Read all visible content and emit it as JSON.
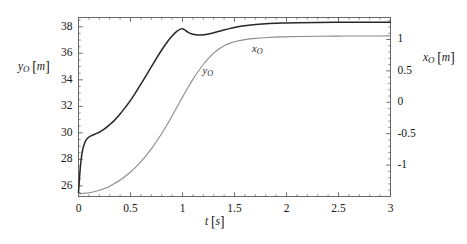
{
  "chart_data": {
    "type": "line",
    "title": "",
    "xlabel": "t [s]",
    "ylabel": "y_O [m]",
    "y2label": "x_O [m]",
    "xlim": [
      0,
      3
    ],
    "ylim": [
      25.2,
      38.7
    ],
    "y2lim": [
      -1.5,
      1.35
    ],
    "grid": false,
    "legend": "inline-curve-labels",
    "xticks": [
      "0",
      "0.5",
      "1",
      "1.5",
      "2",
      "2.5",
      "3"
    ],
    "xtick_values": [
      0,
      0.5,
      1,
      1.5,
      2,
      2.5,
      3
    ],
    "yticks": [
      "26",
      "28",
      "30",
      "32",
      "34",
      "36",
      "38"
    ],
    "ytick_values": [
      26,
      28,
      30,
      32,
      34,
      36,
      38
    ],
    "y2ticks": [
      "-1",
      "-0.5",
      "0",
      "0.5",
      "1"
    ],
    "y2tick_values": [
      -1,
      -0.5,
      0,
      0.5,
      1
    ],
    "x_minor_step": 0.1,
    "y_minor_step": 0.5,
    "y2_minor_step": 0.1,
    "series": [
      {
        "name": "y_O",
        "axis": "left",
        "color": "#262626",
        "width": 1.5,
        "label_text": "y_O",
        "label_x": 1.0,
        "label_y": 34.6,
        "points": [
          [
            0.0,
            25.5
          ],
          [
            0.008,
            26.4
          ],
          [
            0.016,
            27.25
          ],
          [
            0.025,
            27.95
          ],
          [
            0.035,
            28.5
          ],
          [
            0.045,
            28.9
          ],
          [
            0.058,
            29.2
          ],
          [
            0.07,
            29.42
          ],
          [
            0.085,
            29.58
          ],
          [
            0.1,
            29.68
          ],
          [
            0.12,
            29.77
          ],
          [
            0.145,
            29.86
          ],
          [
            0.175,
            29.96
          ],
          [
            0.21,
            30.1
          ],
          [
            0.25,
            30.3
          ],
          [
            0.3,
            30.62
          ],
          [
            0.35,
            30.98
          ],
          [
            0.4,
            31.42
          ],
          [
            0.45,
            31.92
          ],
          [
            0.5,
            32.45
          ],
          [
            0.55,
            33.05
          ],
          [
            0.6,
            33.68
          ],
          [
            0.65,
            34.32
          ],
          [
            0.7,
            34.98
          ],
          [
            0.75,
            35.62
          ],
          [
            0.8,
            36.25
          ],
          [
            0.85,
            36.82
          ],
          [
            0.9,
            37.3
          ],
          [
            0.945,
            37.65
          ],
          [
            0.98,
            37.82
          ],
          [
            1.0,
            37.86
          ],
          [
            1.02,
            37.78
          ],
          [
            1.05,
            37.6
          ],
          [
            1.09,
            37.46
          ],
          [
            1.13,
            37.39
          ],
          [
            1.18,
            37.38
          ],
          [
            1.24,
            37.44
          ],
          [
            1.3,
            37.55
          ],
          [
            1.38,
            37.72
          ],
          [
            1.46,
            37.88
          ],
          [
            1.56,
            38.04
          ],
          [
            1.68,
            38.16
          ],
          [
            1.8,
            38.23
          ],
          [
            1.95,
            38.28
          ],
          [
            2.1,
            38.31
          ],
          [
            2.3,
            38.33
          ],
          [
            2.55,
            38.34
          ],
          [
            2.8,
            38.35
          ],
          [
            3.0,
            38.35
          ]
        ]
      },
      {
        "name": "x_O",
        "axis": "right",
        "color": "#8c8c8c",
        "width": 1.1,
        "label_text": "x_O",
        "label_x": 1.62,
        "label_y_right": 0.9,
        "points": [
          [
            0.0,
            -1.455
          ],
          [
            0.05,
            -1.45
          ],
          [
            0.1,
            -1.44
          ],
          [
            0.15,
            -1.425
          ],
          [
            0.2,
            -1.402
          ],
          [
            0.25,
            -1.372
          ],
          [
            0.3,
            -1.335
          ],
          [
            0.35,
            -1.29
          ],
          [
            0.4,
            -1.238
          ],
          [
            0.45,
            -1.178
          ],
          [
            0.5,
            -1.11
          ],
          [
            0.55,
            -1.032
          ],
          [
            0.6,
            -0.945
          ],
          [
            0.65,
            -0.848
          ],
          [
            0.7,
            -0.742
          ],
          [
            0.75,
            -0.625
          ],
          [
            0.8,
            -0.498
          ],
          [
            0.85,
            -0.362
          ],
          [
            0.9,
            -0.218
          ],
          [
            0.95,
            -0.068
          ],
          [
            1.0,
            0.082
          ],
          [
            1.05,
            0.228
          ],
          [
            1.1,
            0.365
          ],
          [
            1.15,
            0.49
          ],
          [
            1.2,
            0.602
          ],
          [
            1.25,
            0.7
          ],
          [
            1.3,
            0.782
          ],
          [
            1.35,
            0.848
          ],
          [
            1.4,
            0.9
          ],
          [
            1.46,
            0.942
          ],
          [
            1.52,
            0.972
          ],
          [
            1.6,
            0.998
          ],
          [
            1.7,
            1.018
          ],
          [
            1.82,
            1.032
          ],
          [
            1.96,
            1.042
          ],
          [
            2.12,
            1.048
          ],
          [
            2.32,
            1.052
          ],
          [
            2.56,
            1.055
          ],
          [
            2.8,
            1.056
          ],
          [
            3.0,
            1.057
          ]
        ]
      }
    ]
  },
  "axes": {
    "x_axis_label_text": "t [s]",
    "y_axis_label_text": "y_O [m]",
    "y2_axis_label_text": "x_O [m]"
  }
}
